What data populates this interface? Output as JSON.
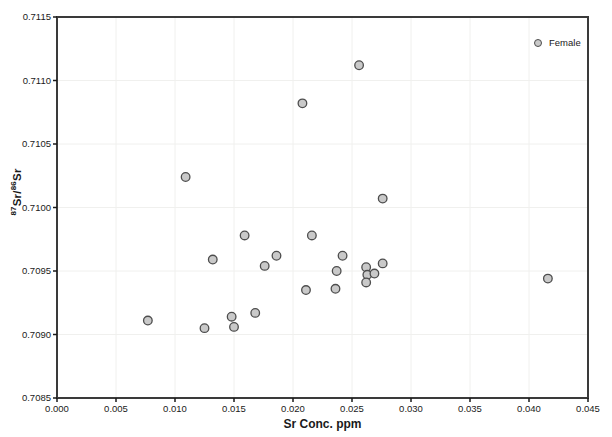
{
  "chart_data": {
    "type": "scatter",
    "xlabel": "Sr Conc. ppm",
    "ylabel_plain": "87Sr/86Sr",
    "ylabel_parts": [
      {
        "text": "87",
        "sup": true
      },
      {
        "text": "Sr/",
        "sup": false
      },
      {
        "text": "86",
        "sup": true
      },
      {
        "text": "Sr",
        "sup": false
      }
    ],
    "xlim": [
      0.0,
      0.045
    ],
    "ylim": [
      0.7085,
      0.7115
    ],
    "xtick_step": 0.005,
    "ytick_step": 0.0005,
    "x_decimals": 3,
    "y_decimals": 4,
    "grid": true,
    "legend": {
      "label": "Female",
      "position": "top-right-inside"
    },
    "colors": {
      "marker_fill": "#c9c9c9",
      "marker_stroke": "#4d4d4d",
      "grid_line": "#f0f0ee",
      "axis_border": "#3a3a3a",
      "tick": "#1a1a1a",
      "text": "#1a1a1a",
      "background": "#ffffff"
    },
    "series": [
      {
        "name": "Female",
        "marker_radius": 4.3,
        "points": [
          {
            "x": 0.0077,
            "y": 0.70911
          },
          {
            "x": 0.0109,
            "y": 0.71024
          },
          {
            "x": 0.0125,
            "y": 0.70905
          },
          {
            "x": 0.0132,
            "y": 0.70959
          },
          {
            "x": 0.0148,
            "y": 0.70914
          },
          {
            "x": 0.015,
            "y": 0.70906
          },
          {
            "x": 0.0159,
            "y": 0.70978
          },
          {
            "x": 0.0168,
            "y": 0.70917
          },
          {
            "x": 0.0176,
            "y": 0.70954
          },
          {
            "x": 0.0186,
            "y": 0.70962
          },
          {
            "x": 0.0208,
            "y": 0.71082
          },
          {
            "x": 0.0211,
            "y": 0.70935
          },
          {
            "x": 0.0216,
            "y": 0.70978
          },
          {
            "x": 0.0236,
            "y": 0.70936
          },
          {
            "x": 0.0237,
            "y": 0.7095
          },
          {
            "x": 0.0242,
            "y": 0.70962
          },
          {
            "x": 0.0256,
            "y": 0.71112
          },
          {
            "x": 0.0262,
            "y": 0.70953
          },
          {
            "x": 0.0263,
            "y": 0.70947
          },
          {
            "x": 0.0262,
            "y": 0.70941
          },
          {
            "x": 0.0269,
            "y": 0.70948
          },
          {
            "x": 0.0276,
            "y": 0.70956
          },
          {
            "x": 0.0276,
            "y": 0.71007
          },
          {
            "x": 0.0416,
            "y": 0.70944
          }
        ]
      }
    ]
  }
}
